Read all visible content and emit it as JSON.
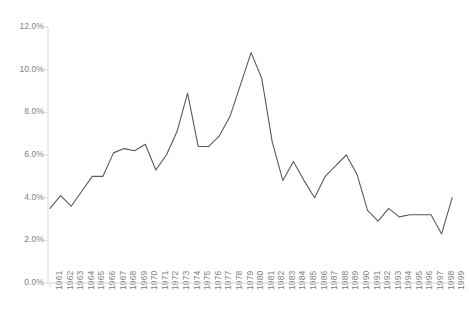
{
  "chart_data": {
    "type": "line",
    "title": "",
    "subtitle": "",
    "xlabel": "",
    "ylabel": "",
    "grid": false,
    "legend": null,
    "legend_position": "none",
    "line_color": "#5a5a5a",
    "axis_color": "#d9d9d9",
    "tick_label_color": "#808080",
    "ylim": [
      0,
      12
    ],
    "yticks": [
      0,
      2,
      4,
      6,
      8,
      10,
      12
    ],
    "ytick_labels": [
      "0.0%",
      "2.0%",
      "4.0%",
      "6.0%",
      "8.0%",
      "10.0%",
      "12.0%"
    ],
    "y_unit": "%",
    "categories": [
      "1961",
      "1962",
      "1963",
      "1964",
      "1965",
      "1966",
      "1967",
      "1968",
      "1969",
      "1970",
      "1971",
      "1972",
      "1973",
      "1974",
      "1975",
      "1976",
      "1977",
      "1978",
      "1979",
      "1980",
      "1981",
      "1982",
      "1983",
      "1984",
      "1985",
      "1986",
      "1987",
      "1988",
      "1989",
      "1990",
      "1991",
      "1992",
      "1993",
      "1994",
      "1995",
      "1996",
      "1997",
      "1998",
      "1999"
    ],
    "values": [
      3.5,
      4.1,
      3.6,
      4.3,
      5.0,
      5.0,
      6.1,
      6.3,
      6.2,
      6.5,
      5.3,
      6.0,
      7.1,
      8.9,
      6.4,
      6.4,
      6.9,
      7.8,
      9.3,
      10.8,
      9.6,
      6.6,
      4.8,
      5.7,
      4.8,
      4.0,
      5.0,
      5.5,
      6.0,
      5.1,
      3.4,
      2.9,
      3.5,
      3.1,
      3.2,
      3.2,
      3.2,
      2.3,
      4.0
    ]
  }
}
